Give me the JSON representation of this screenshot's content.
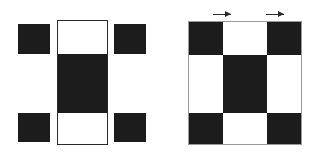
{
  "figure": {
    "canvas": {
      "width": 317,
      "height": 160,
      "background": "#ffffff"
    },
    "palette": {
      "dark": "#1c1c1c",
      "light": "#ffffff",
      "outline": "#2a2a2a",
      "grid_outline": "#9a9a9a",
      "marker": "#2b2b2b"
    },
    "left_assembly": {
      "name": "exploded-strips",
      "description": "Three separated vertical strips; outer strips are dark-light-dark, the wider central panel is light-dark-light.",
      "strips": [
        {
          "id": "left-strip",
          "label": "left outer strip",
          "x": 18,
          "y": 24,
          "width": 32,
          "height": 118,
          "outlined": false,
          "segments": [
            {
              "label": "top segment",
              "tone": "dark",
              "height_pct": 25
            },
            {
              "label": "middle segment",
              "tone": "light",
              "height_pct": 50
            },
            {
              "label": "bottom segment",
              "tone": "dark",
              "height_pct": 25
            }
          ]
        },
        {
          "id": "center-panel",
          "label": "center panel",
          "x": 57,
          "y": 20,
          "width": 51,
          "height": 125,
          "outlined": true,
          "segments": [
            {
              "label": "top segment",
              "tone": "light",
              "height_pct": 27
            },
            {
              "label": "middle segment",
              "tone": "dark",
              "height_pct": 48
            },
            {
              "label": "bottom segment",
              "tone": "light",
              "height_pct": 25
            }
          ]
        },
        {
          "id": "right-strip",
          "label": "right outer strip",
          "x": 114,
          "y": 24,
          "width": 32,
          "height": 118,
          "outlined": false,
          "segments": [
            {
              "label": "top segment",
              "tone": "dark",
              "height_pct": 25
            },
            {
              "label": "middle segment",
              "tone": "light",
              "height_pct": 50
            },
            {
              "label": "bottom segment",
              "tone": "dark",
              "height_pct": 25
            }
          ]
        }
      ]
    },
    "right_assembly": {
      "name": "assembled-grid",
      "description": "Assembled 3x3 checkerboard: dark corners, dark center, light edge cells.",
      "x": 188,
      "y": 21,
      "width": 114,
      "height": 124,
      "rows": 3,
      "columns": 3,
      "column_fractions": [
        0.3,
        0.4,
        0.3
      ],
      "row_fractions": [
        0.27,
        0.48,
        0.25
      ],
      "cells": [
        [
          {
            "label": "top-left",
            "tone": "dark"
          },
          {
            "label": "top-center",
            "tone": "light"
          },
          {
            "label": "top-right",
            "tone": "dark"
          }
        ],
        [
          {
            "label": "middle-left",
            "tone": "light"
          },
          {
            "label": "middle-center",
            "tone": "dark"
          },
          {
            "label": "middle-right",
            "tone": "light"
          }
        ],
        [
          {
            "label": "bottom-left",
            "tone": "dark"
          },
          {
            "label": "bottom-center",
            "tone": "light"
          },
          {
            "label": "bottom-right",
            "tone": "dark"
          }
        ]
      ],
      "markers": [
        {
          "label": "left direction arrow",
          "x": 213,
          "y": 10,
          "width": 18,
          "direction": "right"
        },
        {
          "label": "right direction arrow",
          "x": 266,
          "y": 10,
          "width": 18,
          "direction": "right"
        }
      ]
    }
  }
}
